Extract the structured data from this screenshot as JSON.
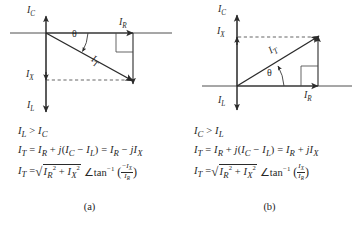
{
  "figure": {
    "type": "phasor-diagram-pair",
    "panels": [
      {
        "id": "a",
        "caption": "(a)",
        "condition": "I_L > I_C",
        "diagram": {
          "axis_labels": {
            "up": "I_C",
            "down": "I_L",
            "right": "I_R",
            "reactive": "I_X",
            "resultant": "I_T",
            "angle": "θ"
          },
          "resultant_direction": "down-right",
          "description": "I_T phasor lags: horizontal I_R component to the right, vertical I_X component downward"
        },
        "equations": [
          "I_L > I_C",
          "I_T = I_R + j(I_C − I_L) = I_R − jI_X",
          "I_T = √(I_R² + I_X²)  ∠tan⁻¹ (−I_X / I_R)"
        ],
        "eq_parts": {
          "cond_left": "I",
          "cond_left_sub": "L",
          "cond_rel": " > ",
          "cond_right": "I",
          "cond_right_sub": "C",
          "line2": "I_T = I_R + j(I_C − I_L) = I_R − jI_X",
          "line3_radicand": "I_R² + I_X²",
          "line3_angle_num": "−I_X",
          "line3_angle_den": "I_R"
        }
      },
      {
        "id": "b",
        "caption": "(b)",
        "condition": "I_C > I_L",
        "diagram": {
          "axis_labels": {
            "up": "I_C",
            "down": "I_L",
            "right": "I_R",
            "reactive": "I_X",
            "resultant": "I_T",
            "angle": "θ"
          },
          "resultant_direction": "up-right",
          "description": "I_T phasor leads: horizontal I_R component to the right, vertical I_X component upward"
        },
        "equations": [
          "I_C > I_L",
          "I_T = I_R + j(I_C − I_L) = I_R + jI_X",
          "I_T = √(I_R² + I_X²)  ∠tan⁻¹ (I_X / I_R)"
        ],
        "eq_parts": {
          "cond_left": "I",
          "cond_left_sub": "C",
          "cond_rel": " > ",
          "cond_right": "I",
          "cond_right_sub": "L",
          "line2": "I_T = I_R + j(I_C − I_L) = I_R + jI_X",
          "line3_radicand": "I_R² + I_X²",
          "line3_angle_num": "I_X",
          "line3_angle_den": "I_R"
        }
      }
    ],
    "glyphs": {
      "I": "I",
      "sub_C": "C",
      "sub_L": "L",
      "sub_R": "R",
      "sub_X": "X",
      "sub_T": "T",
      "theta": "θ",
      "angle_sign": "∠",
      "plus": "+",
      "minus": "−",
      "equals": "=",
      "j": "j",
      "tan_inv": "tan",
      "sup_minus_one": "−1",
      "sup_two": "2",
      "gt": ">",
      "lparen": "(",
      "rparen": ")"
    },
    "colors": {
      "ink": "#262626",
      "line": "#3a3a3a",
      "background": "#ffffff"
    }
  }
}
